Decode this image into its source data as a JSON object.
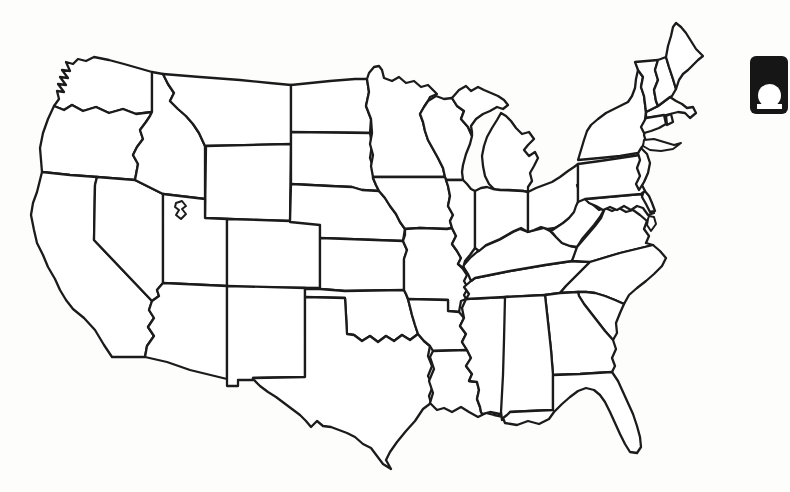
{
  "page": {
    "background": "#fdfdfc"
  },
  "map": {
    "alt": "Blank outline map of the contiguous United States with state borders",
    "stroke_color": "#1b1b1b",
    "fill_color": "#ffffff",
    "states": [
      {
        "abbr": "WA",
        "name": "Washington",
        "d": "M94,57 L86,61 78,59 73,64 66,62 70,71 62,70 68,78 60,77 66,85 58,84 64,92 57,91 59,99 54,106 64,110 72,105 83,111 96,107 109,113 123,109 136,114 152,112 152,72 138,68 124,64 109,60 Z"
      },
      {
        "abbr": "OR",
        "name": "Oregon",
        "d": "M54,106 L48,119 43,133 40,148 41,160 42,172 70,175 97,177 135,180 138,164 133,155 137,147 143,139 140,130 146,122 150,116 152,112 136,114 123,109 109,113 96,107 83,111 72,105 64,110 Z"
      },
      {
        "abbr": "CA",
        "name": "California",
        "d": "M42,172 L70,175 97,177 95,185 94,240 152,301 149,310 154,318 148,327 154,336 147,346 145,357 112,357 104,345 95,330 84,318 73,309 66,300 60,290 55,279 48,267 43,255 37,243 34,230 31,215 33,203 37,192 Z"
      },
      {
        "abbr": "NV",
        "name": "Nevada",
        "d": "M97,177 L135,180 163,194 163,283 157,290 159,296 152,301 94,240 95,185 Z"
      },
      {
        "abbr": "ID",
        "name": "Idaho",
        "d": "M152,72 L152,112 150,116 146,122 140,130 143,139 137,147 133,155 138,164 135,180 163,194 205,199 205,146 199,133 193,124 186,116 178,109 170,101 174,93 168,84 163,74 Z"
      },
      {
        "abbr": "MT",
        "name": "Montana",
        "d": "M163,74 L168,84 174,93 170,101 178,109 186,116 193,124 199,133 205,146 291,144 291,85 270,83 240,80 200,77 Z"
      },
      {
        "abbr": "WY",
        "name": "Wyoming",
        "d": "M206,146 L291,144 290,221 205,218 Z"
      },
      {
        "abbr": "UT",
        "name": "Utah",
        "d": "M163,194 L205,199 205,218 227,219 227,286 163,283 Z"
      },
      {
        "abbr": "CO",
        "name": "Colorado",
        "d": "M227,219 L290,221 320,224 320,288 227,287 Z"
      },
      {
        "abbr": "AZ",
        "name": "Arizona",
        "d": "M163,283 L227,286 227,379 190,370 167,362 145,357 147,346 154,336 148,327 154,318 149,310 152,301 159,296 157,290 Z"
      },
      {
        "abbr": "NM",
        "name": "New Mexico",
        "d": "M227,286 L305,288 305,377 253,378 253,380 238,380 238,386 227,386 Z"
      },
      {
        "abbr": "ND",
        "name": "North Dakota",
        "d": "M291,85 L330,81 355,79 367,79 369,92 366,106 371,119 370,133 291,132 Z"
      },
      {
        "abbr": "SD",
        "name": "South Dakota",
        "d": "M291,132 L370,133 372,145 370,158 374,170 373,178 376,185 379,191 362,190 352,187 330,186 291,184 Z"
      },
      {
        "abbr": "NE",
        "name": "Nebraska",
        "d": "M291,184 L330,186 352,187 362,190 379,191 385,198 390,206 396,214 400,222 405,229 403,241 320,238 320,225 290,222 Z"
      },
      {
        "abbr": "KS",
        "name": "Kansas",
        "d": "M320,238 L403,241 407,250 404,259 404,290 345,291 320,289 Z"
      },
      {
        "abbr": "OK",
        "name": "Oklahoma",
        "d": "M305,289 L320,289 345,291 404,290 406,294 408,299 412,315 415,325 418,334 410,340 402,335 394,341 386,336 378,342 370,336 362,341 354,335 347,334 346,315 345,298 305,297 Z"
      },
      {
        "abbr": "TX",
        "name": "Texas",
        "d": "M305,297 L345,298 346,315 347,334 354,335 362,341 370,336 378,342 386,336 394,341 402,335 410,340 418,334 424,341 430,346 428,356 432,366 428,376 433,386 429,396 431,403 423,409 415,421 406,431 397,442 390,452 386,460 391,469 383,464 377,456 371,448 363,444 355,437 347,433 339,430 331,427 323,426 317,421 311,427 306,421 300,415 292,409 284,403 276,397 268,392 260,386 253,379 253,378 305,377 Z"
      },
      {
        "abbr": "MN",
        "name": "Minnesota",
        "d": "M367,79 L369,73 374,67 379,66 382,70 384,78 392,81 399,77 406,83 414,81 421,87 428,85 434,91 437,94 430,97 428,101 424,107 420,114 423,122 425,131 428,140 433,149 438,158 443,168 445,177 373,177 371,166 373,155 370,144 372,133 371,119 366,106 369,92 Z"
      },
      {
        "abbr": "WI",
        "name": "Wisconsin",
        "d": "M428,101 L436,96 444,99 452,98 457,106 464,111 461,119 468,127 472,136 470,144 466,154 463,165 462,172 463,180 446,180 445,177 443,168 438,158 433,149 428,140 425,131 423,122 420,114 424,107 Z"
      },
      {
        "abbr": "MI",
        "name": "Michigan",
        "d": "M452,98 L459,90 466,86 471,91 478,87 484,90 491,93 498,96 504,100 508,105 503,109 497,107 490,111 483,114 476,119 471,126 472,132 472,136 468,127 461,119 464,111 457,106 Z M495,190 L489,184 485,176 483,166 482,156 484,146 487,137 492,128 497,120 501,113 506,116 511,121 516,128 522,134 529,132 534,139 528,145 524,150 529,156 535,152 538,158 534,166 530,173 532,181 528,187 528,192 523,191 509,190 Z"
      },
      {
        "abbr": "IA",
        "name": "Iowa",
        "d": "M373,177 L445,177 448,186 450,196 448,206 453,215 450,221 452,228 447,229 420,228 405,229 400,222 396,214 390,206 385,198 379,191 376,185 373,178 Z"
      },
      {
        "abbr": "MO",
        "name": "Missouri",
        "d": "M405,229 L420,228 447,229 452,228 456,236 452,244 457,251 461,258 458,264 463,269 467,275 464,281 468,288 464,295 466,299 461,301 459,312 448,311 448,300 408,299 406,294 404,290 404,259 407,250 403,241 405,235 Z"
      },
      {
        "abbr": "AR",
        "name": "Arkansas",
        "d": "M408,299 L448,300 448,311 459,312 464,318 460,326 466,334 462,342 467,350 433,351 430,346 424,341 418,334 415,325 412,315 Z"
      },
      {
        "abbr": "LA",
        "name": "Louisiana",
        "d": "M433,351 L467,350 471,358 466,366 472,374 469,381 477,382 479,390 477,399 480,407 481,412 488,406 495,403 501,410 504,417 494,415 486,413 478,417 469,412 461,407 452,412 444,408 437,410 430,403 433,393 429,381 434,369 430,357 Z"
      },
      {
        "abbr": "MS",
        "name": "Mississippi",
        "d": "M466,299 L505,297 507,330 509,365 511,395 512,410 500,414 490,412 482,414 481,412 480,407 477,399 479,390 477,382 469,381 472,374 466,366 471,358 467,350 462,342 466,334 460,326 464,318 462,308 Z"
      },
      {
        "abbr": "TN",
        "name": "Tennessee",
        "d": "M475,278 L510,271 545,265 572,261 590,262 584,268 578,274 572,280 566,286 560,293 545,295 505,297 466,299 469,294 464,287 471,281 Z"
      },
      {
        "abbr": "KY",
        "name": "Kentucky",
        "d": "M475,278 L510,271 545,265 572,261 578,248 570,246 562,243 556,237 550,231 544,228 536,230 528,232 520,229 513,232 506,236 499,240 492,243 485,246 477,252 470,258 463,266 468,274 471,281 Z"
      },
      {
        "abbr": "IL",
        "name": "Illinois",
        "d": "M446,180 L463,180 467,184 471,189 475,191 475,248 470,255 465,261 463,268 458,264 461,258 457,251 452,244 456,236 452,228 450,221 453,215 448,206 450,196 448,186 Z"
      },
      {
        "abbr": "IN",
        "name": "Indiana",
        "d": "M475,191 L481,188 487,187 493,189 500,190 523,191 528,192 528,232 521,228 514,231 507,235 500,239 493,242 486,245 479,251 475,248 Z"
      },
      {
        "abbr": "OH",
        "name": "Ohio",
        "d": "M528,192 L536,188 544,185 552,182 560,177 568,171 574,167 578,164 578,202 575,213 569,219 562,224 555,228 548,229 541,227 534,230 528,232 Z"
      },
      {
        "abbr": "WV",
        "name": "West Virginia",
        "d": "M578,202 L580,193 577,185 582,183 584,192 585,199 592,204 599,210 605,208 600,217 594,225 588,232 582,239 577,247 570,246 562,243 556,237 551,231 557,227 563,223 569,218 574,212 576,206 Z"
      },
      {
        "abbr": "VA",
        "name": "Virginia",
        "d": "M577,247 L583,240 589,233 595,226 601,218 605,208 612,211 619,208 626,212 633,210 640,215 647,221 644,229 649,236 646,243 653,245 620,253 590,262 572,261 Z"
      },
      {
        "abbr": "MD",
        "name": "Maryland",
        "d": "M585,199 L641,194 645,201 650,209 654,213 648,215 643,208 637,206 631,210 624,206 617,210 610,207 603,210 596,206 589,203 Z"
      },
      {
        "abbr": "DE",
        "name": "Delaware",
        "d": "M644,190 L649,196 652,203 655,211 650,212 646,204 642,197 Z"
      },
      {
        "abbr": "PA",
        "name": "Pennsylvania",
        "d": "M578,164 L600,161 620,158 640,155 644,161 640,169 646,177 642,185 645,191 641,194 585,199 578,202 Z"
      },
      {
        "abbr": "NJ",
        "name": "New Jersey",
        "d": "M641,148 L647,154 650,163 648,173 644,182 639,190 636,184 640,176 637,168 640,160 638,153 Z"
      },
      {
        "abbr": "NY",
        "name": "New York",
        "d": "M578,160 L581,150 584,140 587,131 591,125 598,119 606,113 614,109 622,105 628,102 632,96 635,88 636,79 638,70 643,77 641,87 644,96 645,104 646,112 645,120 646,128 644,135 646,142 641,148 638,153 620,156 600,158 Z"
      },
      {
        "abbr": "MA",
        "name": "Massachusetts",
        "d": "M646,112 L658,106 670,97 676,101 682,104 687,108 693,107 696,113 690,118 685,113 678,112 670,114 662,116 654,117 646,118 Z"
      },
      {
        "abbr": "CT",
        "name": "Connecticut",
        "d": "M646,118 L664,115 666,124 659,128 651,131 644,133 641,127 Z"
      },
      {
        "abbr": "RI",
        "name": "Rhode Island",
        "d": "M666,116 L671,114 673,122 667,125 Z"
      },
      {
        "abbr": "VT",
        "name": "Vermont",
        "d": "M635,62 L658,60 655,70 658,80 654,90 656,101 658,106 646,112 645,104 644,96 641,87 643,77 638,70 Z"
      },
      {
        "abbr": "NH",
        "name": "New Hampshire",
        "d": "M658,60 L666,57 669,67 673,79 676,89 672,96 670,97 658,106 656,101 654,90 658,80 655,70 Z"
      },
      {
        "abbr": "ME",
        "name": "Maine",
        "d": "M666,57 L668,46 671,36 673,27 676,23 681,27 686,33 691,41 696,49 703,56 698,60 693,65 688,70 683,74 679,80 676,89 673,79 669,67 Z"
      },
      {
        "abbr": "NC",
        "name": "North Carolina",
        "d": "M590,262 L620,253 653,245 660,251 666,258 662,266 654,274 646,281 637,288 629,295 624,304 615,300 605,296 595,293 586,292 578,292 560,293 566,286 572,280 578,274 584,268 Z"
      },
      {
        "abbr": "SC",
        "name": "South Carolina",
        "d": "M578,292 L586,292 595,293 605,296 615,300 624,304 620,313 616,323 617,333 613,340 605,331 598,322 591,313 584,304 579,296 Z"
      },
      {
        "abbr": "GA",
        "name": "Georgia",
        "d": "M560,293 L578,292 579,296 584,304 591,313 598,322 605,331 613,340 616,349 612,358 615,366 612,372 580,374 553,375 551,350 548,322 545,295 Z"
      },
      {
        "abbr": "AL",
        "name": "Alabama",
        "d": "M505,297 L545,295 548,322 551,350 553,375 553,410 530,411 510,412 507,418 502,420 501,412 503,375 504,340 Z"
      },
      {
        "abbr": "FL",
        "name": "Florida",
        "d": "M510,412 L530,411 553,410 553,375 580,374 612,372 618,381 623,392 628,403 633,414 637,426 640,437 641,447 637,453 630,452 625,444 620,434 615,423 610,412 605,402 600,395 594,390 586,388 578,391 570,397 562,404 554,412 549,419 539,424 528,421 517,425 505,423 503,418 507,415 Z"
      }
    ],
    "features": [
      {
        "id": "great-salt-lake",
        "name": "Great Salt Lake",
        "d": "M176,203 L182,201 186,206 182,209 186,214 181,219 176,215 179,210 175,207 Z"
      },
      {
        "id": "long-island",
        "name": "Long Island (New York)",
        "d": "M644,140 L654,139 664,142 674,145 681,143 673,149 661,151 650,150 643,146 Z"
      },
      {
        "id": "virginia-eastern-shore",
        "name": "Eastern Shore peninsula (Virginia)",
        "d": "M649,216 L654,217 656,224 651,231 647,225 648,219 Z"
      }
    ]
  },
  "corner_icon": {
    "name": "slide-marker",
    "background_color": "#161616",
    "glyph_color": "#ffffff",
    "left": 750,
    "top": 56
  }
}
